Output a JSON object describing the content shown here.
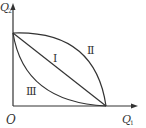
{
  "diagram": {
    "axes": {
      "x_label": "Q",
      "x_sub": "1",
      "y_label": "Q",
      "y_sub": "2",
      "origin_label": "O"
    },
    "regions": [
      {
        "id": "I",
        "label": "Ⅰ",
        "description": "straight line"
      },
      {
        "id": "II",
        "label": "Ⅱ",
        "description": "concave (bowed outward) curve"
      },
      {
        "id": "III",
        "label": "Ⅲ",
        "description": "convex (bowed inward) curve"
      }
    ],
    "colors": {
      "line": "#333333",
      "background": "#ffffff"
    }
  }
}
